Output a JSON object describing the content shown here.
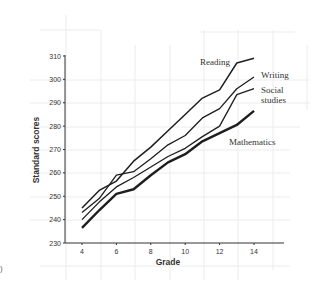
{
  "chart_data": {
    "type": "line",
    "title": "",
    "xlabel": "Grade",
    "ylabel": "Standard scores",
    "x": [
      4,
      5,
      6,
      7,
      8,
      9,
      10,
      11,
      12,
      13,
      14
    ],
    "xticks": [
      4,
      6,
      8,
      10,
      12,
      14
    ],
    "yticks": [
      230,
      240,
      250,
      260,
      270,
      280,
      290,
      300,
      310
    ],
    "xlim": [
      3,
      15.5
    ],
    "ylim": [
      230,
      310
    ],
    "grid": false,
    "legend": "direct labels at line ends",
    "series": [
      {
        "name": "Reading",
        "values": [
          245,
          252.5,
          256.5,
          265,
          271,
          278,
          285,
          292,
          295.5,
          307,
          309
        ]
      },
      {
        "name": "Writing",
        "values": [
          243,
          249,
          259,
          260.5,
          266,
          272,
          276,
          283.5,
          287.5,
          296,
          301
        ]
      },
      {
        "name": "Social studies",
        "values": [
          240,
          247.5,
          254,
          258,
          262.5,
          267,
          270.5,
          275.5,
          280,
          293.5,
          296
        ]
      },
      {
        "name": "Mathematics",
        "values": [
          236.5,
          244,
          251,
          253,
          259,
          264.5,
          268,
          273.5,
          277,
          280.5,
          286.5
        ]
      }
    ],
    "labels": {
      "reading": "Reading",
      "writing": "Writing",
      "social_1": "Social",
      "social_2": "studies",
      "mathematics": "Mathematics"
    }
  },
  "edge_mark": ")"
}
